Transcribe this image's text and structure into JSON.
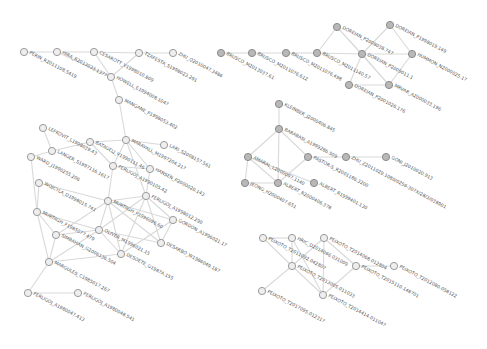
{
  "diagram": {
    "type": "co-authorship network",
    "width": 487,
    "height": 349,
    "colors": {
      "edge": "#d9d9d9",
      "node_open_fill": "#eeeeee",
      "node_filled_fill": "#b8b8b8",
      "label": "#555555"
    },
    "nodes": [
      {
        "id": "n1",
        "label": "PERIN_R2011108.5419",
        "x": 24,
        "y": 52,
        "style": "open"
      },
      {
        "id": "n2",
        "label": "HIRA_R2013033.1377",
        "x": 57,
        "y": 52,
        "style": "open"
      },
      {
        "id": "n3",
        "label": "CESAROTT_V1998010.809",
        "x": 94,
        "y": 52,
        "style": "open"
      },
      {
        "id": "n4",
        "label": "TZAFESTA_S1998023.291",
        "x": 139,
        "y": 53,
        "style": "open"
      },
      {
        "id": "n5",
        "label": "ZHU_Q2010047.3486",
        "x": 173,
        "y": 53,
        "style": "open"
      },
      {
        "id": "n6",
        "label": "HOWELL_E1994008.1047",
        "x": 111,
        "y": 77,
        "style": "open"
      },
      {
        "id": "n7",
        "label": "MANGANE_P1998053.402",
        "x": 119,
        "y": 100,
        "style": "open"
      },
      {
        "id": "n8",
        "label": "LEFKOVIT_L1998039.43",
        "x": 43,
        "y": 128,
        "style": "open"
      },
      {
        "id": "n9",
        "label": "BATAGELJ_V1990111.46",
        "x": 90,
        "y": 142,
        "style": "open"
      },
      {
        "id": "n10",
        "label": "MARAVALL_M1997204.217",
        "x": 126,
        "y": 140,
        "style": "open"
      },
      {
        "id": "n11",
        "label": "LARI_S2008157.561",
        "x": 164,
        "y": 145,
        "style": "open"
      },
      {
        "id": "n12",
        "label": "LANGER_S1997116.1617",
        "x": 52,
        "y": 151,
        "style": "open"
      },
      {
        "id": "n13",
        "label": "WARD_J1990255.206",
        "x": 31,
        "y": 157,
        "style": "open"
      },
      {
        "id": "n14",
        "label": "FERLIGOJ_A1990105.42",
        "x": 113,
        "y": 166,
        "style": "open"
      },
      {
        "id": "n15",
        "label": "HANSEN_P2000020.143",
        "x": 150,
        "y": 169,
        "style": "open"
      },
      {
        "id": "n16",
        "label": "WOJCYLA_D1998015.741",
        "x": 39,
        "y": 183,
        "style": "open"
      },
      {
        "id": "n17",
        "label": "FERLIGOJ_A1998012.290",
        "x": 146,
        "y": 196,
        "style": "open"
      },
      {
        "id": "n18",
        "label": "MURTAGH_F1996096.60",
        "x": 108,
        "y": 201,
        "style": "open"
      },
      {
        "id": "n19",
        "label": "MURTAGH_F1985077.479",
        "x": 37,
        "y": 212,
        "style": "open"
      },
      {
        "id": "n20",
        "label": "GORDON_A1996021.17",
        "x": 173,
        "y": 220,
        "style": "open"
      },
      {
        "id": "n21",
        "label": "OLIVER_M1996021.15",
        "x": 99,
        "y": 230,
        "style": "open"
      },
      {
        "id": "n22",
        "label": "SIMBAHAN_G2006136.504",
        "x": 56,
        "y": 235,
        "style": "open"
      },
      {
        "id": "n23",
        "label": "DESARBO_W1986049.187",
        "x": 161,
        "y": 243,
        "style": "open"
      },
      {
        "id": "n24",
        "label": "DESOETE_G1987A.155",
        "x": 121,
        "y": 254,
        "style": "open"
      },
      {
        "id": "n25",
        "label": "MARGULES_C1985017.267",
        "x": 49,
        "y": 262,
        "style": "open"
      },
      {
        "id": "n26",
        "label": "FERLIGOJ_A1980047.413",
        "x": 28,
        "y": 293,
        "style": "open"
      },
      {
        "id": "n27",
        "label": "FERLIGOJ_A1980048.541",
        "x": 78,
        "y": 293,
        "style": "open"
      },
      {
        "id": "m1",
        "label": "BRUSCO_M2013037.61",
        "x": 221,
        "y": 53,
        "style": "filled"
      },
      {
        "id": "m2",
        "label": "BRUSCO_M2011076.612",
        "x": 252,
        "y": 53,
        "style": "filled"
      },
      {
        "id": "m3",
        "label": "BRUSCO_M2011076.498",
        "x": 286,
        "y": 53,
        "style": "filled"
      },
      {
        "id": "m4",
        "label": "BRUSCO_M2011140.57",
        "x": 317,
        "y": 53,
        "style": "filled"
      },
      {
        "id": "m5",
        "label": "DOREIAN_P2008038.747",
        "x": 337,
        "y": 27,
        "style": "filled"
      },
      {
        "id": "m6",
        "label": "DOREIAN_P1998019.149",
        "x": 390,
        "y": 25,
        "style": "filled"
      },
      {
        "id": "m7",
        "label": "DOREIAN_P2009011.1",
        "x": 362,
        "y": 54,
        "style": "filled"
      },
      {
        "id": "m8",
        "label": "HUMMON_N2000025.17",
        "x": 412,
        "y": 54,
        "style": "filled"
      },
      {
        "id": "m9",
        "label": "DOREIAN_P2001026.176",
        "x": 349,
        "y": 85,
        "style": "filled"
      },
      {
        "id": "m10",
        "label": "MRVAR_A2000033.196",
        "x": 389,
        "y": 85,
        "style": "filled"
      },
      {
        "id": "k1",
        "label": "KLEINBER_J2000406.845",
        "x": 279,
        "y": 104,
        "style": "filled"
      },
      {
        "id": "k2",
        "label": "BARABASI_A1999286.509",
        "x": 279,
        "y": 129,
        "style": "filled"
      },
      {
        "id": "k3",
        "label": "AMARAL_L2000097.1140",
        "x": 248,
        "y": 157,
        "style": "filled"
      },
      {
        "id": "k4",
        "label": "PASTOR-S_R2001186.3200",
        "x": 308,
        "y": 157,
        "style": "filled"
      },
      {
        "id": "k5",
        "label": "ZHU_Z2011029.1080/0256-307X/28/3/038901",
        "x": 346,
        "y": 157,
        "style": "filled"
      },
      {
        "id": "k6",
        "label": "GONI_J2010020.913",
        "x": 386,
        "y": 157,
        "style": "filled"
      },
      {
        "id": "k7",
        "label": "JEONG_H2000407.651",
        "x": 245,
        "y": 183,
        "style": "filled"
      },
      {
        "id": "k8",
        "label": "ALBERT_R2000406.378",
        "x": 278,
        "y": 183,
        "style": "filled"
      },
      {
        "id": "k9",
        "label": "ALBERT_R1999401.130",
        "x": 314,
        "y": 183,
        "style": "filled"
      },
      {
        "id": "p1",
        "label": "PEIXOTO_T2011092.042807",
        "x": 263,
        "y": 238,
        "style": "open"
      },
      {
        "id": "p2",
        "label": "HRIC_D2014066.031009",
        "x": 292,
        "y": 238,
        "style": "open"
      },
      {
        "id": "p3",
        "label": "PEIXOTO_T2014068.012804",
        "x": 324,
        "y": 238,
        "style": "open"
      },
      {
        "id": "p4",
        "label": "PEIXOTO_T2015110.148701",
        "x": 356,
        "y": 266,
        "style": "open"
      },
      {
        "id": "p5",
        "label": "PEIXOTO_T2012080.058122",
        "x": 394,
        "y": 266,
        "style": "open"
      },
      {
        "id": "p6",
        "label": "PEIXOTO_T2013005.011033",
        "x": 292,
        "y": 266,
        "style": "open"
      },
      {
        "id": "p7",
        "label": "PEIXOTO_T2017095.012317",
        "x": 262,
        "y": 291,
        "style": "open"
      },
      {
        "id": "p8",
        "label": "PEIXOTO_T2014414.011047",
        "x": 323,
        "y": 295,
        "style": "open"
      }
    ],
    "edges": [
      [
        "n1",
        "n2"
      ],
      [
        "n2",
        "n3"
      ],
      [
        "n3",
        "n4"
      ],
      [
        "n4",
        "n5"
      ],
      [
        "n3",
        "n6"
      ],
      [
        "n4",
        "n6"
      ],
      [
        "n2",
        "n6"
      ],
      [
        "n6",
        "n7"
      ],
      [
        "n7",
        "n10"
      ],
      [
        "n10",
        "n9"
      ],
      [
        "n10",
        "n11"
      ],
      [
        "n10",
        "n15"
      ],
      [
        "n10",
        "n17"
      ],
      [
        "n10",
        "n14"
      ],
      [
        "n8",
        "n12"
      ],
      [
        "n12",
        "n13"
      ],
      [
        "n12",
        "n9"
      ],
      [
        "n9",
        "n14"
      ],
      [
        "n14",
        "n15"
      ],
      [
        "n15",
        "n17"
      ],
      [
        "n16",
        "n19"
      ],
      [
        "n16",
        "n18"
      ],
      [
        "n17",
        "n18"
      ],
      [
        "n17",
        "n20"
      ],
      [
        "n17",
        "n21"
      ],
      [
        "n17",
        "n23"
      ],
      [
        "n17",
        "n24"
      ],
      [
        "n18",
        "n21"
      ],
      [
        "n18",
        "n20"
      ],
      [
        "n18",
        "n24"
      ],
      [
        "n18",
        "n23"
      ],
      [
        "n18",
        "n22"
      ],
      [
        "n19",
        "n21"
      ],
      [
        "n19",
        "n22"
      ],
      [
        "n19",
        "n25"
      ],
      [
        "n21",
        "n22"
      ],
      [
        "n21",
        "n25"
      ],
      [
        "n21",
        "n24"
      ],
      [
        "n21",
        "n23"
      ],
      [
        "n22",
        "n25"
      ],
      [
        "n24",
        "n25"
      ],
      [
        "n20",
        "n23"
      ],
      [
        "n20",
        "n24"
      ],
      [
        "n25",
        "n26"
      ],
      [
        "n26",
        "n27"
      ],
      [
        "n14",
        "n18"
      ],
      [
        "n13",
        "n19"
      ],
      [
        "m1",
        "m2"
      ],
      [
        "m2",
        "m3"
      ],
      [
        "m3",
        "m4"
      ],
      [
        "m4",
        "m7"
      ],
      [
        "m4",
        "m5"
      ],
      [
        "m5",
        "m7"
      ],
      [
        "m5",
        "m10"
      ],
      [
        "m7",
        "m6"
      ],
      [
        "m7",
        "m8"
      ],
      [
        "m6",
        "m8"
      ],
      [
        "m7",
        "m9"
      ],
      [
        "m7",
        "m10"
      ],
      [
        "m8",
        "m10"
      ],
      [
        "m9",
        "m10"
      ],
      [
        "k1",
        "k2"
      ],
      [
        "k2",
        "k3"
      ],
      [
        "k2",
        "k4"
      ],
      [
        "k2",
        "k8"
      ],
      [
        "k3",
        "k8"
      ],
      [
        "k3",
        "k9"
      ],
      [
        "k4",
        "k5"
      ],
      [
        "k5",
        "k6"
      ],
      [
        "k4",
        "k8"
      ],
      [
        "k7",
        "k8"
      ],
      [
        "k3",
        "k7"
      ],
      [
        "p1",
        "p2"
      ],
      [
        "p1",
        "p6"
      ],
      [
        "p2",
        "p6"
      ],
      [
        "p3",
        "p6"
      ],
      [
        "p3",
        "p4"
      ],
      [
        "p3",
        "p8"
      ],
      [
        "p4",
        "p5"
      ],
      [
        "p4",
        "p8"
      ],
      [
        "p6",
        "p7"
      ],
      [
        "p6",
        "p8"
      ],
      [
        "p2",
        "p8"
      ]
    ]
  }
}
